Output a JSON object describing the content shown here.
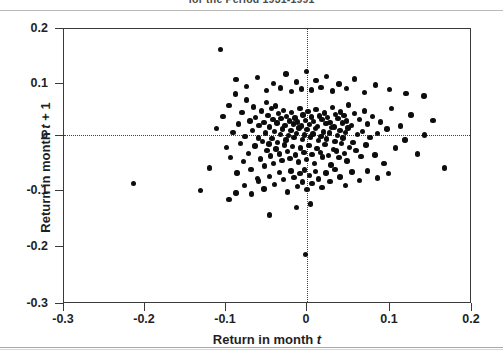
{
  "figure": {
    "title": "for the Period 1931-1991",
    "background_color": "#ffffff",
    "frame_color": "#3a3a3a",
    "point_color": "#0d0d0d"
  },
  "axes": {
    "x_label_prefix": "Return in month ",
    "x_label_italic": "t",
    "y_label_prefix": "Return in month ",
    "y_label_italic": "t",
    "y_label_suffix": " + 1",
    "x_ticks": [
      "-0.3",
      "-0.2",
      "-0.1",
      "0",
      "0.1",
      "0.2"
    ],
    "y_ticks": [
      "0.2",
      "0.1",
      "0",
      "-0.1",
      "-0.2",
      "-0.3"
    ]
  },
  "chart_data": {
    "type": "scatter",
    "title": "for the Period 1931-1991",
    "xlabel": "Return in month t",
    "ylabel": "Return in month t + 1",
    "xlim": [
      -0.3,
      0.2
    ],
    "ylim": [
      -0.3,
      0.2
    ],
    "xticks": [
      -0.3,
      -0.2,
      -0.1,
      0,
      0.1,
      0.2
    ],
    "yticks": [
      -0.3,
      -0.2,
      -0.1,
      0,
      0.1,
      0.2
    ],
    "grid": false,
    "legend": null,
    "reference_lines": [
      {
        "orientation": "horizontal",
        "value": 0,
        "style": "dotted"
      },
      {
        "orientation": "vertical",
        "value": 0,
        "style": "dotted"
      }
    ],
    "series": [
      {
        "name": "Monthly stock returns",
        "marker": "filled-circle",
        "color": "#0d0d0d",
        "points": [
          [
            -0.108,
            0.163
          ],
          [
            -0.215,
            -0.081
          ],
          [
            -0.133,
            -0.094
          ],
          [
            -0.122,
            -0.053
          ],
          [
            -0.113,
            0.019
          ],
          [
            -0.105,
            0.041
          ],
          [
            -0.101,
            -0.015
          ],
          [
            -0.098,
            0.061
          ],
          [
            -0.096,
            -0.034
          ],
          [
            -0.093,
            0.012
          ],
          [
            -0.09,
            0.082
          ],
          [
            -0.088,
            -0.062
          ],
          [
            -0.086,
            0.027
          ],
          [
            -0.084,
            -0.008
          ],
          [
            -0.082,
            0.048
          ],
          [
            -0.08,
            -0.041
          ],
          [
            -0.078,
            0.005
          ],
          [
            -0.076,
            0.071
          ],
          [
            -0.074,
            -0.026
          ],
          [
            -0.072,
            0.033
          ],
          [
            -0.071,
            -0.055
          ],
          [
            -0.069,
            0.016
          ],
          [
            -0.068,
            0.058
          ],
          [
            -0.066,
            -0.013
          ],
          [
            -0.065,
            0.039
          ],
          [
            -0.063,
            -0.072
          ],
          [
            -0.062,
            0.002
          ],
          [
            -0.061,
            0.025
          ],
          [
            -0.059,
            -0.036
          ],
          [
            -0.058,
            0.051
          ],
          [
            -0.057,
            -0.004
          ],
          [
            -0.055,
            0.03
          ],
          [
            -0.054,
            -0.049
          ],
          [
            -0.053,
            0.011
          ],
          [
            -0.052,
            0.066
          ],
          [
            -0.051,
            -0.021
          ],
          [
            -0.05,
            0.043
          ],
          [
            -0.049,
            -0.009
          ],
          [
            -0.048,
            0.022
          ],
          [
            -0.047,
            -0.031
          ],
          [
            -0.046,
            0.055
          ],
          [
            -0.045,
            0.001
          ],
          [
            -0.044,
            0.035
          ],
          [
            -0.043,
            -0.044
          ],
          [
            -0.042,
            0.014
          ],
          [
            -0.041,
            0.06
          ],
          [
            -0.04,
            -0.018
          ],
          [
            -0.039,
            0.029
          ],
          [
            -0.038,
            -0.006
          ],
          [
            -0.037,
            0.046
          ],
          [
            -0.036,
            -0.027
          ],
          [
            -0.035,
            0.008
          ],
          [
            -0.034,
            0.037
          ],
          [
            -0.033,
            -0.039
          ],
          [
            -0.032,
            0.018
          ],
          [
            -0.031,
            0.052
          ],
          [
            -0.03,
            -0.011
          ],
          [
            -0.029,
            0.025
          ],
          [
            -0.028,
            -0.002
          ],
          [
            -0.027,
            0.041
          ],
          [
            -0.026,
            -0.023
          ],
          [
            -0.025,
            0.006
          ],
          [
            -0.024,
            0.033
          ],
          [
            -0.023,
            -0.035
          ],
          [
            -0.022,
            0.015
          ],
          [
            -0.021,
            0.048
          ],
          [
            -0.02,
            -0.014
          ],
          [
            -0.019,
            0.027
          ],
          [
            -0.018,
            0.003
          ],
          [
            -0.017,
            0.038
          ],
          [
            -0.016,
            -0.029
          ],
          [
            -0.015,
            0.01
          ],
          [
            -0.014,
            0.031
          ],
          [
            -0.013,
            -0.042
          ],
          [
            -0.012,
            0.02
          ],
          [
            -0.011,
            0.056
          ],
          [
            -0.01,
            -0.016
          ],
          [
            -0.009,
            0.024
          ],
          [
            -0.008,
            -0.001
          ],
          [
            -0.007,
            0.044
          ],
          [
            -0.006,
            -0.025
          ],
          [
            -0.005,
            0.007
          ],
          [
            -0.004,
            0.034
          ],
          [
            -0.003,
            -0.037
          ],
          [
            -0.002,
            0.017
          ],
          [
            -0.001,
            0.05
          ],
          [
            0.0,
            -0.012
          ],
          [
            0.001,
            0.026
          ],
          [
            0.002,
            0.004
          ],
          [
            0.003,
            0.04
          ],
          [
            0.004,
            -0.028
          ],
          [
            0.005,
            0.009
          ],
          [
            0.006,
            0.032
          ],
          [
            0.007,
            -0.045
          ],
          [
            0.008,
            0.019
          ],
          [
            0.009,
            0.054
          ],
          [
            0.01,
            -0.017
          ],
          [
            0.011,
            0.023
          ],
          [
            0.012,
            -0.003
          ],
          [
            0.013,
            0.042
          ],
          [
            0.014,
            -0.024
          ],
          [
            0.015,
            0.005
          ],
          [
            0.016,
            0.036
          ],
          [
            0.017,
            -0.033
          ],
          [
            0.018,
            0.013
          ],
          [
            0.019,
            0.047
          ],
          [
            0.02,
            -0.01
          ],
          [
            0.021,
            0.028
          ],
          [
            0.022,
            0.0
          ],
          [
            0.023,
            0.039
          ],
          [
            0.024,
            -0.03
          ],
          [
            0.025,
            0.011
          ],
          [
            0.026,
            0.03
          ],
          [
            0.027,
            -0.047
          ],
          [
            0.028,
            0.021
          ],
          [
            0.029,
            0.057
          ],
          [
            0.03,
            -0.019
          ],
          [
            0.031,
            0.022
          ],
          [
            0.032,
            -0.005
          ],
          [
            0.033,
            0.045
          ],
          [
            0.034,
            -0.022
          ],
          [
            0.035,
            0.006
          ],
          [
            0.036,
            0.037
          ],
          [
            0.037,
            -0.034
          ],
          [
            0.038,
            0.016
          ],
          [
            0.039,
            0.049
          ],
          [
            0.04,
            -0.008
          ],
          [
            0.041,
            0.029
          ],
          [
            0.042,
            0.002
          ],
          [
            0.043,
            0.043
          ],
          [
            0.044,
            -0.026
          ],
          [
            0.045,
            0.012
          ],
          [
            0.046,
            0.033
          ],
          [
            0.047,
            -0.04
          ],
          [
            0.048,
            0.02
          ],
          [
            0.049,
            0.062
          ],
          [
            0.05,
            -0.015
          ],
          [
            0.052,
            0.025
          ],
          [
            0.054,
            -0.006
          ],
          [
            0.056,
            0.046
          ],
          [
            0.058,
            -0.021
          ],
          [
            0.06,
            0.008
          ],
          [
            0.062,
            0.035
          ],
          [
            0.064,
            -0.032
          ],
          [
            0.066,
            0.014
          ],
          [
            0.068,
            0.051
          ],
          [
            0.07,
            -0.011
          ],
          [
            0.072,
            0.027
          ],
          [
            0.075,
            0.003
          ],
          [
            0.078,
            0.041
          ],
          [
            0.081,
            -0.029
          ],
          [
            0.084,
            0.01
          ],
          [
            0.088,
            0.031
          ],
          [
            0.092,
            -0.044
          ],
          [
            0.096,
            0.018
          ],
          [
            0.101,
            0.055
          ],
          [
            0.106,
            -0.016
          ],
          [
            0.112,
            0.024
          ],
          [
            0.118,
            -0.002
          ],
          [
            0.125,
            0.044
          ],
          [
            0.133,
            -0.027
          ],
          [
            0.142,
            0.007
          ],
          [
            0.152,
            0.034
          ],
          [
            0.166,
            -0.053
          ],
          [
            -0.098,
            -0.11
          ],
          [
            -0.089,
            -0.098
          ],
          [
            -0.079,
            -0.085
          ],
          [
            -0.07,
            -0.1
          ],
          [
            -0.062,
            -0.076
          ],
          [
            -0.055,
            -0.091
          ],
          [
            -0.048,
            -0.068
          ],
          [
            -0.042,
            -0.083
          ],
          [
            -0.036,
            -0.061
          ],
          [
            -0.031,
            -0.074
          ],
          [
            -0.026,
            -0.096
          ],
          [
            -0.022,
            -0.058
          ],
          [
            -0.018,
            -0.07
          ],
          [
            -0.014,
            -0.086
          ],
          [
            -0.011,
            -0.063
          ],
          [
            -0.008,
            -0.078
          ],
          [
            -0.005,
            -0.056
          ],
          [
            -0.002,
            -0.092
          ],
          [
            0.001,
            -0.066
          ],
          [
            0.004,
            -0.081
          ],
          [
            0.008,
            -0.059
          ],
          [
            0.012,
            -0.073
          ],
          [
            0.016,
            -0.088
          ],
          [
            0.021,
            -0.062
          ],
          [
            0.026,
            -0.077
          ],
          [
            0.032,
            -0.055
          ],
          [
            0.038,
            -0.069
          ],
          [
            0.045,
            -0.084
          ],
          [
            0.053,
            -0.06
          ],
          [
            0.062,
            -0.075
          ],
          [
            0.072,
            -0.058
          ],
          [
            0.084,
            -0.071
          ],
          [
            0.098,
            -0.063
          ],
          [
            -0.004,
            -0.21
          ],
          [
            -0.048,
            -0.138
          ],
          [
            -0.015,
            -0.125
          ],
          [
            0.002,
            -0.118
          ],
          [
            -0.089,
            0.108
          ],
          [
            -0.076,
            0.096
          ],
          [
            -0.063,
            0.112
          ],
          [
            -0.052,
            0.088
          ],
          [
            -0.043,
            0.101
          ],
          [
            -0.035,
            0.093
          ],
          [
            -0.028,
            0.118
          ],
          [
            -0.021,
            0.086
          ],
          [
            -0.015,
            0.104
          ],
          [
            -0.009,
            0.091
          ],
          [
            -0.003,
            0.123
          ],
          [
            0.003,
            0.089
          ],
          [
            0.009,
            0.106
          ],
          [
            0.015,
            0.094
          ],
          [
            0.022,
            0.114
          ],
          [
            0.029,
            0.087
          ],
          [
            0.037,
            0.1
          ],
          [
            0.046,
            0.092
          ],
          [
            0.056,
            0.109
          ],
          [
            0.068,
            0.085
          ],
          [
            0.082,
            0.098
          ],
          [
            0.099,
            0.09
          ],
          [
            0.119,
            0.083
          ],
          [
            0.141,
            0.078
          ]
        ]
      }
    ],
    "n_points": 228
  }
}
